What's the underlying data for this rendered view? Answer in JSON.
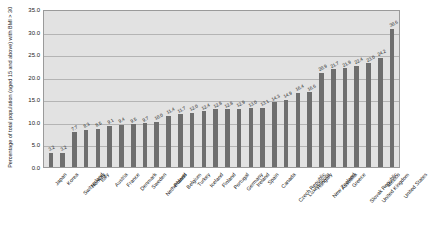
{
  "chart_data": {
    "type": "bar",
    "title": "",
    "xlabel": "",
    "ylabel": "Percentage of total population (aged 15 and above) with BMI > 30",
    "ylim": [
      0.0,
      35.0
    ],
    "yticks": [
      "0.0",
      "5.0",
      "10.0",
      "15.0",
      "20.0",
      "25.0",
      "30.0",
      "35.0"
    ],
    "grid": true,
    "legend": "none",
    "bar_color": "#6e6e6e",
    "plot_background": "#e2e2e2",
    "categories": [
      "Japan",
      "Korea",
      "Switzerland",
      "Norway",
      "Italy",
      "Austria",
      "France",
      "Denmark",
      "Sweden",
      "Netherlands",
      "Poland",
      "Belgium",
      "Turkey",
      "Iceland",
      "Finland",
      "Portugal",
      "Germany",
      "Ireland",
      "Spain",
      "Canada",
      "Czech Republic",
      "Luxembourg",
      "Hungary",
      "New Zealand",
      "Australia",
      "Greece",
      "Slovak Republic",
      "United Kingdom",
      "Mexico",
      "United States"
    ],
    "values": [
      3.2,
      3.2,
      7.7,
      8.3,
      8.5,
      9.1,
      9.4,
      9.5,
      9.7,
      10.0,
      11.4,
      11.7,
      12.0,
      12.4,
      12.8,
      12.8,
      12.9,
      13.0,
      13.1,
      14.3,
      14.9,
      16.4,
      16.6,
      20.9,
      21.7,
      21.9,
      22.4,
      23.0,
      24.2,
      30.6
    ],
    "value_labels": [
      "3.2",
      "3.2",
      "7.7",
      "8.3",
      "8.5",
      "9.1",
      "9.4",
      "9.5",
      "9.7",
      "10.0",
      "11.4",
      "11.7",
      "12.0",
      "12.4",
      "12.8",
      "12.8",
      "12.9",
      "13.0",
      "13.1",
      "14.3",
      "14.9",
      "16.4",
      "16.6",
      "20.9",
      "21.7",
      "21.9",
      "22.4",
      "23.0",
      "24.2",
      "30.6"
    ]
  }
}
